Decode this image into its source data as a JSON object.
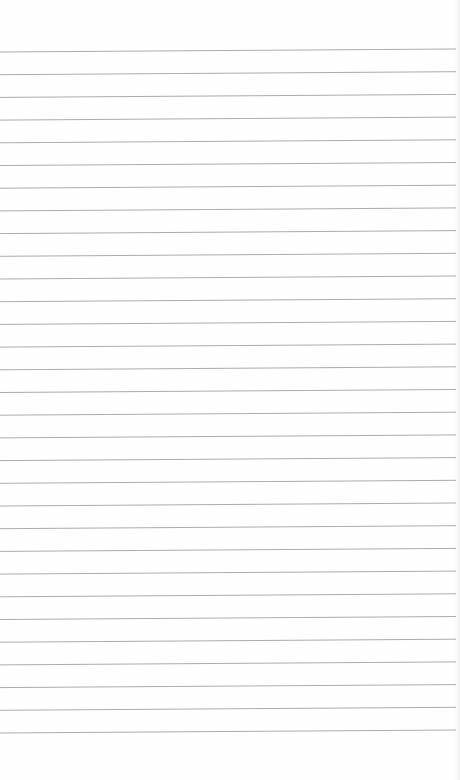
{
  "paper": {
    "type": "ruled-notebook-page",
    "background_color": "#fefefe",
    "line_color": "#ababab",
    "line_count": 31,
    "first_line_y_left": 52,
    "first_line_y_right": 49,
    "line_spacing": 22.7
  }
}
